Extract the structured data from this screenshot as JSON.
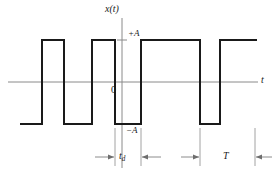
{
  "figure": {
    "type": "waveform-plot",
    "background": "#ffffff",
    "signal_color": "#1a1a1a",
    "axis_color": "#8a8a8a",
    "labels": {
      "y_axis": "x(t)",
      "x_axis": "t",
      "origin": "0",
      "level_high": "+A",
      "level_low": "−A",
      "pulse_width_main": "t",
      "pulse_width_sub": "d",
      "period": "T"
    }
  },
  "chart_data": {
    "type": "line",
    "title": "",
    "xlabel": "t",
    "ylabel": "x(t)",
    "subtype": "bipolar-square-wave",
    "amplitude_label_high": "+A",
    "amplitude_label_low": "-A",
    "levels": [
      1,
      -1
    ],
    "bit_duration_label": "t_d",
    "period_label": "T",
    "annotations": [
      {
        "name": "t_d",
        "from_px": 115,
        "to_px": 141,
        "label": "t_d",
        "meaning": "pulse width"
      },
      {
        "name": "T",
        "from_px": 200,
        "to_px": 255,
        "label": "T",
        "meaning": "period"
      }
    ],
    "segments": [
      {
        "level": -1,
        "x_start": 20,
        "x_end": 42
      },
      {
        "level": 1,
        "x_start": 42,
        "x_end": 64
      },
      {
        "level": -1,
        "x_start": 64,
        "x_end": 92
      },
      {
        "level": 1,
        "x_start": 92,
        "x_end": 115
      },
      {
        "level": -1,
        "x_start": 115,
        "x_end": 141
      },
      {
        "level": 1,
        "x_start": 141,
        "x_end": 200
      },
      {
        "level": -1,
        "x_start": 200,
        "x_end": 220
      },
      {
        "level": 1,
        "x_start": 220,
        "x_end": 257
      }
    ],
    "values": [
      -1,
      1,
      -1,
      1,
      -1,
      1,
      -1,
      1
    ],
    "grid": false,
    "legend": null,
    "axis_origin_px": {
      "x": 122,
      "y": 82
    },
    "y_high_px": 40,
    "y_low_px": 124
  }
}
